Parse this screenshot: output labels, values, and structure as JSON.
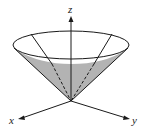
{
  "figure": {
    "axes": {
      "x_label": "x",
      "y_label": "y",
      "z_label": "z"
    },
    "colors": {
      "line": "#1a1a1a",
      "shade": "#b3b3b3",
      "background": "#ffffff"
    }
  }
}
